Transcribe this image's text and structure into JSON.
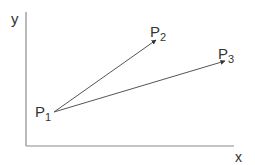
{
  "diagram": {
    "axes": {
      "x_label": "x",
      "y_label": "y",
      "color": "#8a8a8a"
    },
    "points": [
      {
        "id": "P1",
        "label": "P",
        "subscript": "1",
        "x": 54,
        "y": 112
      },
      {
        "id": "P2",
        "label": "P",
        "subscript": "2",
        "x": 156,
        "y": 40
      },
      {
        "id": "P3",
        "label": "P",
        "subscript": "3",
        "x": 225,
        "y": 61
      }
    ],
    "vectors": [
      {
        "from": "P1",
        "to": "P2"
      },
      {
        "from": "P1",
        "to": "P3"
      }
    ],
    "line_color": "#555555"
  }
}
